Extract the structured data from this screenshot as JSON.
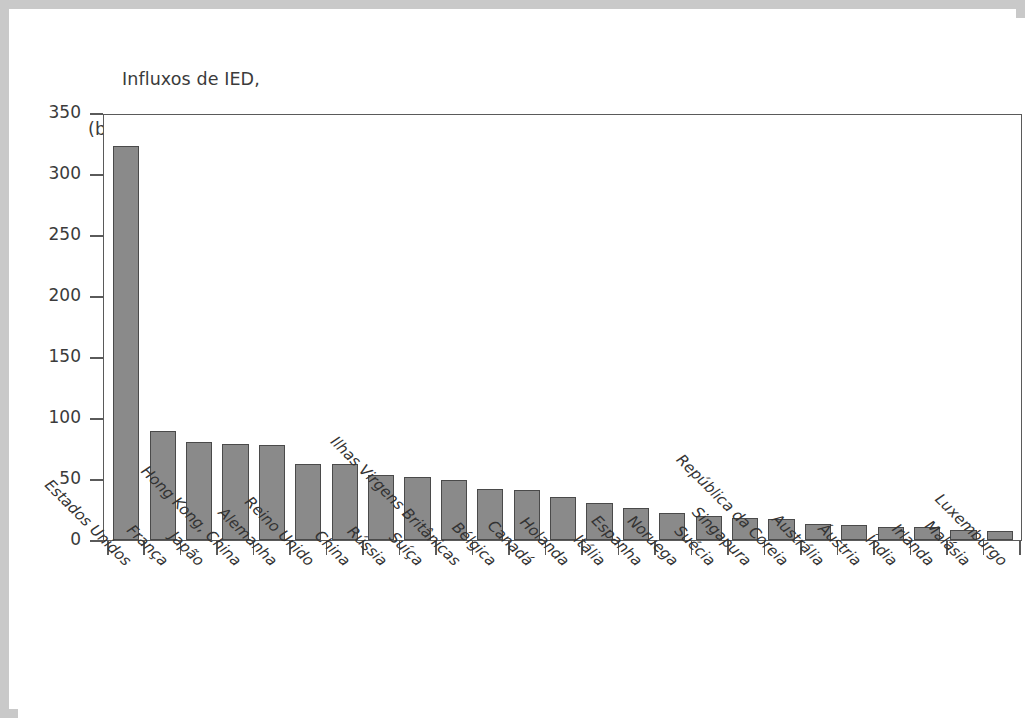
{
  "figure": {
    "title_line1": "Influxos de IED,",
    "title_line2": "(bilhões de dólares americanos)",
    "bar_color": "#8a8a8a",
    "bar_edge_color": "#4a4a4a",
    "axis_color": "#5a5a5a",
    "frame_color": "#c9c9c9",
    "text_color": "#3b3b3b"
  },
  "chart_data": {
    "type": "bar",
    "title": "Influxos de IED, (bilhões de dólares americanos)",
    "xlabel": "",
    "ylabel": "Influxos de IED, (bilhões de dólares americanos)",
    "ylim": [
      0,
      350
    ],
    "yticks": [
      0,
      50,
      100,
      150,
      200,
      250,
      300,
      350
    ],
    "ytick_labels": [
      "0",
      "50",
      "100",
      "150",
      "200",
      "250",
      "300",
      "350"
    ],
    "grid": false,
    "legend": false,
    "orientation": "vertical",
    "categories": [
      "Estados Unidos",
      "França",
      "Japão",
      "Hong Kong, China",
      "Alemanha",
      "Reino Unido",
      "China",
      "Rússia",
      "Suíça",
      "Ilhas Virgens Britânicas",
      "Bélgica",
      "Canadá",
      "Holanda",
      "Itália",
      "Espanha",
      "Noruega",
      "Suécia",
      "Singapura",
      "República da Coreia",
      "Austrália",
      "Áustria",
      "Índia",
      "Irlanda",
      "Malásia",
      "Luxemburgo"
    ],
    "values": [
      323,
      89,
      80,
      79,
      78,
      62,
      62,
      53,
      52,
      49,
      42,
      41,
      35,
      30,
      26,
      22,
      20,
      18,
      17,
      13,
      12,
      11,
      11,
      8,
      7
    ]
  }
}
